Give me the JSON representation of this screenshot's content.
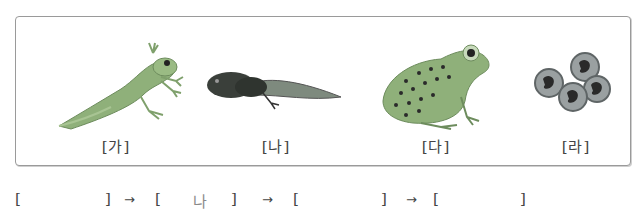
{
  "figure": {
    "items": [
      {
        "id": "ga",
        "label": "[가]",
        "depicts": "froglet with tail"
      },
      {
        "id": "na",
        "label": "[나]",
        "depicts": "tadpole with hind legs"
      },
      {
        "id": "da",
        "label": "[다]",
        "depicts": "adult frog"
      },
      {
        "id": "ra",
        "label": "[라]",
        "depicts": "frog eggs"
      }
    ]
  },
  "answer_sequence": {
    "open_bracket": "[",
    "close_bracket": "]",
    "arrow": "→",
    "slots": [
      "",
      "나",
      "",
      ""
    ]
  },
  "colors": {
    "frog_green": "#8fb07a",
    "tadpole_dark": "#3a3f3a",
    "egg_gray": "#7a7f80",
    "border": "#9a9a9a"
  }
}
